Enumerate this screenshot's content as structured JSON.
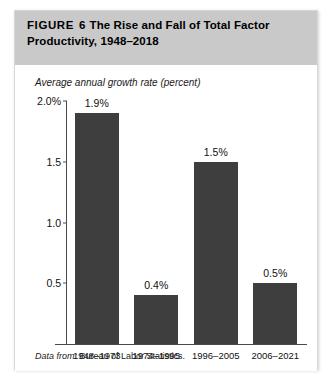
{
  "figure": {
    "label": "FIGURE",
    "number": "6",
    "title_line_1": "The Rise and Fall of Total Factor",
    "title_line_2": "Productivity, 1948–2018",
    "source_label": "Data from:",
    "source_text": "Bureau of Labor Statistics."
  },
  "colors": {
    "title_band": "#c9c9c9",
    "bar_fill": "#3e3e3e",
    "axis": "#4a4a4a",
    "text": "#111111"
  },
  "chart_data": {
    "type": "bar",
    "subtitle": "Average annual growth rate (percent)",
    "xlabel": "",
    "ylabel": "Average annual growth rate (percent)",
    "ylim": [
      0,
      2.0
    ],
    "yticks": [
      0.5,
      1.0,
      1.5,
      2.0
    ],
    "ytick_labels": [
      "0.5",
      "1.0",
      "1.5",
      "2.0%"
    ],
    "grid": false,
    "legend": false,
    "categories": [
      "1948–1973",
      "1974–1995",
      "1996–2005",
      "2006–2021"
    ],
    "values": [
      1.9,
      0.4,
      1.5,
      0.5
    ],
    "value_labels": [
      "1.9%",
      "0.4%",
      "1.5%",
      "0.5%"
    ],
    "source": "Data from: Bureau of Labor Statistics."
  }
}
